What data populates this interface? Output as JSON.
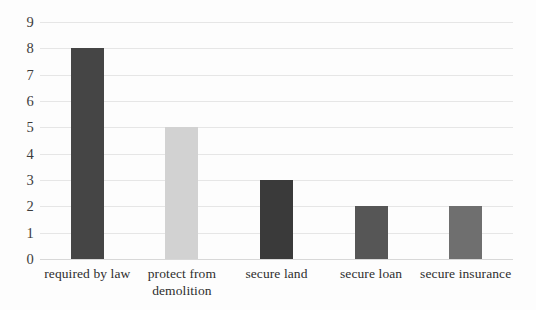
{
  "chart_data": {
    "type": "bar",
    "title": "",
    "subtitle": "",
    "xlabel": "",
    "ylabel": "",
    "categories": [
      "required by law",
      "protect from demolition",
      "secure land",
      "secure loan",
      "secure insurance"
    ],
    "values": [
      8,
      5,
      3,
      2,
      2
    ],
    "ylim": [
      0,
      9
    ],
    "ytick_labels": [
      "0",
      "1",
      "2",
      "3",
      "4",
      "5",
      "6",
      "7",
      "8",
      "9"
    ],
    "ytick_values": [
      0,
      1,
      2,
      3,
      4,
      5,
      6,
      7,
      8,
      9
    ],
    "grid": true,
    "legend": false,
    "legend_position": "none",
    "bar_colors": [
      "#454545",
      "#d2d2d2",
      "#3a3a3a",
      "#565656",
      "#6f6f6f"
    ],
    "gridline_color": "#e6e6e6",
    "axis_color": "#d8d8d8",
    "background_color": "#fdfdfd",
    "tick_label_color": "#3c3c3c",
    "category_label_color": "#2e2e2e"
  }
}
